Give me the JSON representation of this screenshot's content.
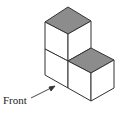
{
  "diagram": {
    "type": "isometric-cube-stack",
    "cube_count": 3,
    "label": "Front",
    "colors": {
      "top_face": "#8c8c8c",
      "side_face": "#ffffff",
      "stroke": "#333333"
    }
  }
}
